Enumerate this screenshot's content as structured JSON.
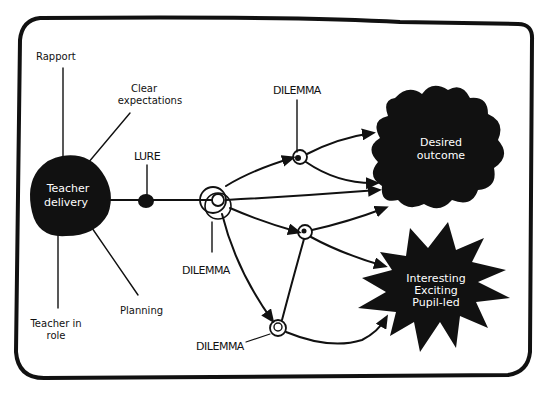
{
  "diagram": {
    "central_node": {
      "label_line1": "Teacher",
      "label_line2": "delivery"
    },
    "factors": {
      "rapport": "Rapport",
      "clear_expectations_line1": "Clear",
      "clear_expectations_line2": "expectations",
      "planning": "Planning",
      "teacher_in_role_line1": "Teacher in",
      "teacher_in_role_line2": "role"
    },
    "lure": "LURE",
    "dilemmas": {
      "top": "DILEMMA",
      "left": "DILEMMA",
      "bottom": "DILEMMA"
    },
    "outcomes": {
      "desired_line1": "Desired",
      "desired_line2": "outcome",
      "starburst_line1": "Interesting",
      "starburst_line2": "Exciting",
      "starburst_line3": "Pupil-led"
    },
    "colors": {
      "ink": "#111111",
      "background": "#ffffff"
    }
  }
}
